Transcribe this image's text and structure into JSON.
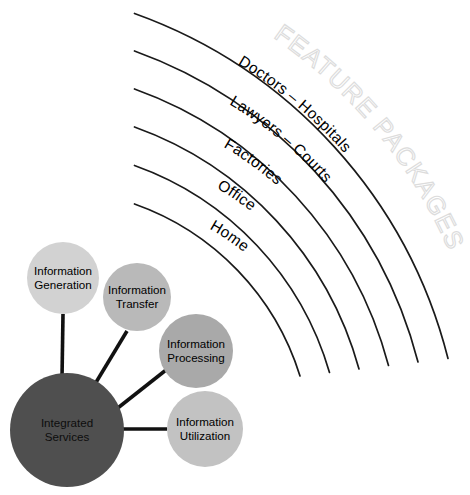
{
  "diagram": {
    "title_watermark": "FEATURE PACKAGES",
    "arcs": [
      {
        "label": "",
        "radius": 500
      },
      {
        "label": "Doctors  –  Hospitals",
        "radius": 452
      },
      {
        "label": "Lawyers  –  Courts",
        "radius": 404
      },
      {
        "label": "Factories",
        "radius": 356
      },
      {
        "label": "Office",
        "radius": 308
      },
      {
        "label": "Home",
        "radius": 260
      }
    ],
    "arc_labels": [
      "Doctors  –  Hospitals",
      "Lawyers  –  Courts",
      "Factories",
      "Office",
      "Home"
    ],
    "hub": {
      "label_line1": "Integrated",
      "label_line2": "Services",
      "color": "#4f4f4f"
    },
    "nodes": [
      {
        "label_line1": "Information",
        "label_line2": "Generation",
        "color": "#d2d2d2",
        "cx": 63,
        "cy": 278,
        "r": 36
      },
      {
        "label_line1": "Information",
        "label_line2": "Transfer",
        "color": "#b9b9b9",
        "cx": 137,
        "cy": 297,
        "r": 34
      },
      {
        "label_line1": "Information",
        "label_line2": "Processing",
        "color": "#a9a9a9",
        "cx": 196,
        "cy": 351,
        "r": 37
      },
      {
        "label_line1": "Information",
        "label_line2": "Utilization",
        "color": "#c2c2c2",
        "cx": 205,
        "cy": 429,
        "r": 38
      }
    ],
    "colors": {
      "hub_fill": "#4f4f4f",
      "arc_stroke": "#1a1a1a",
      "spoke_stroke": "#111111",
      "watermark_stroke": "#dcdcdc",
      "background": "#ffffff"
    }
  }
}
